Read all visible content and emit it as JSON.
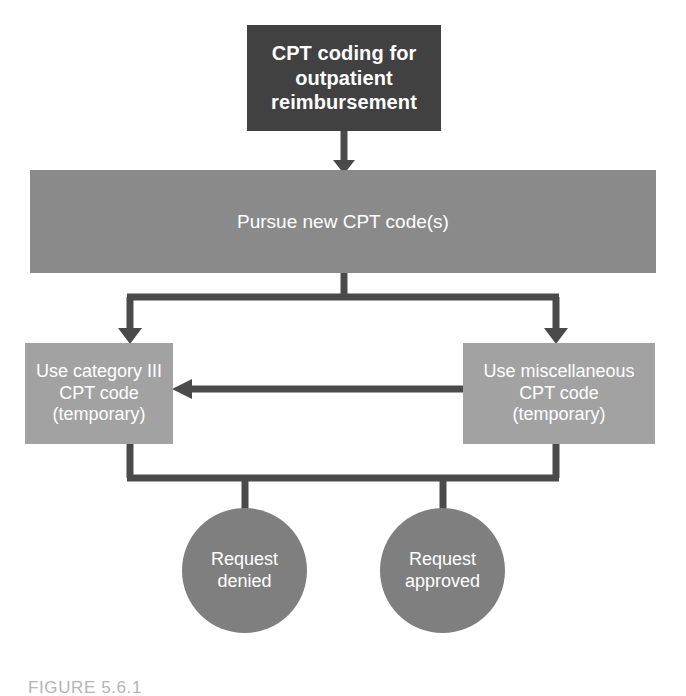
{
  "figure": {
    "caption": "FIGURE 5.6.1"
  },
  "colors": {
    "start_box": "#414141",
    "process_box": "#8a8a8a",
    "option_box": "#a2a2a2",
    "outcome_circle": "#7f7f7f",
    "connector": "#4a4a4a",
    "label_text": "#ffffff",
    "caption_text": "#b4b4b4",
    "background": "#ffffff"
  },
  "nodes": {
    "start": {
      "label": "CPT coding for\noutpatient\nreimbursement",
      "shape": "rectangle"
    },
    "pursue": {
      "label": "Pursue new CPT code(s)",
      "shape": "rectangle"
    },
    "category_three": {
      "label": "Use category III\nCPT code\n(temporary)",
      "shape": "rectangle"
    },
    "miscellaneous": {
      "label": "Use miscellaneous\nCPT code\n(temporary)",
      "shape": "rectangle"
    },
    "request_denied": {
      "label": "Request\ndenied",
      "shape": "circle"
    },
    "request_approved": {
      "label": "Request\napproved",
      "shape": "circle"
    }
  },
  "edges": [
    {
      "id": "start-to-pursue",
      "from": "start",
      "to": "pursue",
      "direction": "down",
      "label": ""
    },
    {
      "id": "pursue-to-category-three",
      "from": "pursue",
      "to": "category_three",
      "direction": "down-left",
      "label": ""
    },
    {
      "id": "pursue-to-miscellaneous",
      "from": "pursue",
      "to": "miscellaneous",
      "direction": "down-right",
      "label": ""
    },
    {
      "id": "miscellaneous-to-category-three",
      "from": "miscellaneous",
      "to": "category_three",
      "direction": "left",
      "label": ""
    },
    {
      "id": "options-to-request-denied",
      "from": "options",
      "to": "request_denied",
      "direction": "down",
      "label": ""
    },
    {
      "id": "options-to-request-approved",
      "from": "options",
      "to": "request_approved",
      "direction": "down",
      "label": ""
    }
  ]
}
